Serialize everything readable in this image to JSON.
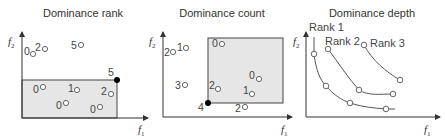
{
  "panels": [
    {
      "title": "Dominance rank",
      "axes": {
        "x": "f",
        "x_sub": "1",
        "y": "f",
        "y_sub": "2"
      },
      "highlight_point": {
        "label": "5"
      },
      "points": [
        {
          "label": "0"
        },
        {
          "label": "2"
        },
        {
          "label": "5"
        },
        {
          "label": "0"
        },
        {
          "label": "1"
        },
        {
          "label": "2"
        },
        {
          "label": "0"
        },
        {
          "label": "0"
        }
      ]
    },
    {
      "title": "Dominance count",
      "axes": {
        "x": "f",
        "x_sub": "1",
        "y": "f",
        "y_sub": "2"
      },
      "highlight_point": {
        "label": "4"
      },
      "points": [
        {
          "label": "2"
        },
        {
          "label": "1"
        },
        {
          "label": "0"
        },
        {
          "label": "3"
        },
        {
          "label": "2"
        },
        {
          "label": "0"
        },
        {
          "label": "1"
        },
        {
          "label": "2"
        }
      ]
    },
    {
      "title": "Dominance depth",
      "axes": {
        "x": "f",
        "x_sub": "1",
        "y": "f",
        "y_sub": "2"
      },
      "fronts": [
        {
          "label": "Rank 1"
        },
        {
          "label": "Rank 2"
        },
        {
          "label": "Rank 3"
        }
      ]
    }
  ],
  "colors": {
    "region_fill": "#e6e6e6",
    "axis": "#333333",
    "point_stroke": "#555555",
    "highlight": "#000000"
  }
}
